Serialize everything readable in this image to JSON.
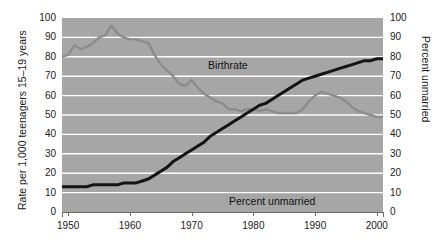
{
  "chart_data": {
    "type": "line",
    "title": "",
    "xlabel": "",
    "ylabel": "Rate per 1,000 teenagers 15–19 years",
    "ylabel_right": "Percent unmarried",
    "xlim": [
      1949,
      2001
    ],
    "ylim": [
      0,
      100
    ],
    "ylim_right": [
      0,
      100
    ],
    "grid": true,
    "legend_position": "inline-annotation",
    "xticks": [
      1950,
      1960,
      1970,
      1980,
      1990,
      2000
    ],
    "xtick_labels": [
      "1950",
      "1960",
      "1970",
      "1980",
      "1990",
      "2000"
    ],
    "yticks": [
      0,
      10,
      20,
      30,
      40,
      50,
      60,
      70,
      80,
      90,
      100
    ],
    "ytick_labels": [
      "0",
      "10",
      "20",
      "30",
      "40",
      "50",
      "60",
      "70",
      "80",
      "90",
      "100"
    ],
    "yticks_right": [
      0,
      10,
      20,
      30,
      40,
      50,
      60,
      70,
      80,
      90,
      100
    ],
    "ytick_labels_right": [
      "0",
      "10",
      "20",
      "30",
      "40",
      "50",
      "60",
      "70",
      "80",
      "90",
      "100"
    ],
    "series": [
      {
        "name": "Birthrate",
        "color": "#8c8c8c",
        "axis": "left",
        "x": [
          1949,
          1950,
          1951,
          1952,
          1953,
          1954,
          1955,
          1956,
          1957,
          1958,
          1959,
          1960,
          1961,
          1962,
          1963,
          1964,
          1965,
          1966,
          1967,
          1968,
          1969,
          1970,
          1971,
          1972,
          1973,
          1974,
          1975,
          1976,
          1977,
          1978,
          1979,
          1980,
          1981,
          1982,
          1983,
          1984,
          1985,
          1986,
          1987,
          1988,
          1989,
          1990,
          1991,
          1992,
          1993,
          1994,
          1995,
          1996,
          1997,
          1998,
          1999,
          2000,
          2001
        ],
        "values": [
          80,
          81,
          86,
          84,
          85,
          87,
          90,
          91,
          96,
          92,
          90,
          89,
          89,
          88,
          87,
          81,
          76,
          73,
          70,
          66,
          65,
          68,
          64,
          61,
          59,
          57,
          56,
          53,
          53,
          52,
          53,
          53,
          52,
          53,
          52,
          51,
          51,
          51,
          51,
          53,
          57,
          60,
          62,
          61,
          60,
          59,
          57,
          54,
          52,
          51,
          50,
          49,
          49
        ]
      },
      {
        "name": "Percent unmarried",
        "color": "#141414",
        "axis": "right",
        "x": [
          1949,
          1950,
          1951,
          1952,
          1953,
          1954,
          1955,
          1956,
          1957,
          1958,
          1959,
          1960,
          1961,
          1962,
          1963,
          1964,
          1965,
          1966,
          1967,
          1968,
          1969,
          1970,
          1971,
          1972,
          1973,
          1974,
          1975,
          1976,
          1977,
          1978,
          1979,
          1980,
          1981,
          1982,
          1983,
          1984,
          1985,
          1986,
          1987,
          1988,
          1989,
          1990,
          1991,
          1992,
          1993,
          1994,
          1995,
          1996,
          1997,
          1998,
          1999,
          2000,
          2001
        ],
        "values": [
          13,
          13,
          13,
          13,
          13,
          14,
          14,
          14,
          14,
          14,
          15,
          15,
          15,
          16,
          17,
          19,
          21,
          23,
          26,
          28,
          30,
          32,
          34,
          36,
          39,
          41,
          43,
          45,
          47,
          49,
          51,
          53,
          55,
          56,
          58,
          60,
          62,
          64,
          66,
          68,
          69,
          70,
          71,
          72,
          73,
          74,
          75,
          76,
          77,
          78,
          78,
          79,
          79
        ]
      }
    ],
    "annotations": [
      {
        "text": "Birthrate",
        "x": 1963,
        "y": 82
      },
      {
        "text": "Percent unmarried",
        "x": 1966,
        "y": 16
      }
    ]
  },
  "colors": {
    "plot_background": "#a6a6a6",
    "gridline": "#ffffff",
    "birthrate_line": "#8c8c8c",
    "unmarried_line": "#141414",
    "axis": "#6b6b6b",
    "text": "#1a1a1a",
    "page_background": "#ffffff"
  }
}
